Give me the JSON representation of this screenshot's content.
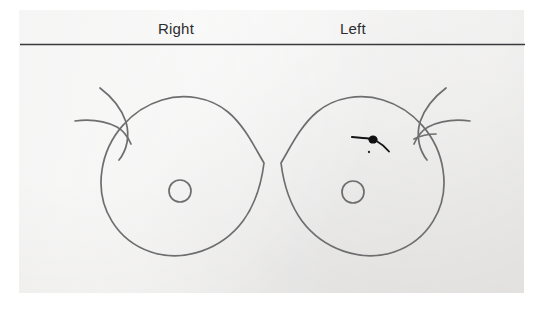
{
  "form": {
    "name": "breast-diagram-form",
    "background_color": "#eeedec",
    "page_color": "#ffffff"
  },
  "header": {
    "right_label": "Right",
    "left_label": "Left",
    "rule_color": "#3a3a3c"
  },
  "diagram": {
    "type": "breast-schematic-anterior-view",
    "ink_color": "#6e6e70",
    "mark_color": "#111111",
    "right_breast": {
      "label": "Right",
      "outline_center_x": 181,
      "outline_center_y": 178,
      "outline_radius": 80,
      "nipple": {
        "cx": 180,
        "cy": 191,
        "r": 11
      },
      "findings": []
    },
    "left_breast": {
      "label": "Left",
      "outline_center_x": 352,
      "outline_center_y": 178,
      "outline_radius": 80,
      "nipple": {
        "cx": 353,
        "cy": 192,
        "r": 11
      },
      "findings": [
        {
          "kind": "lesion-mark",
          "description": "filled ink blob with hand-drawn leader stroke",
          "x": 372,
          "y": 139,
          "quadrant": "upper-outer"
        }
      ]
    }
  }
}
